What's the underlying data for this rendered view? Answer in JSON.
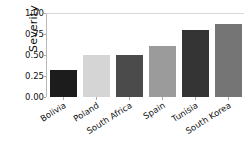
{
  "chart_data": {
    "type": "bar",
    "title": "",
    "xlabel": "",
    "ylabel": "Severity",
    "categories": [
      "Bolivia",
      "Poland",
      "South Africa",
      "Spain",
      "Tunisia",
      "South Korea"
    ],
    "values": [
      0.32,
      0.5,
      0.5,
      0.61,
      0.8,
      0.87
    ],
    "bar_colors": [
      "#1c1c1c",
      "#d5d5d5",
      "#4b4b4b",
      "#9b9b9b",
      "#343434",
      "#757575"
    ],
    "ylim": [
      0.0,
      1.0
    ],
    "yticks": [
      0.0,
      0.25,
      0.5,
      0.75,
      1.0
    ],
    "ytick_labels": [
      "0.00",
      "0.25",
      "0.50",
      "0.75",
      "1.00"
    ],
    "grid": false,
    "legend": null,
    "background_color": "#ffffff",
    "axis_color": "#b9b9b9",
    "xtick_rotation": -32
  }
}
